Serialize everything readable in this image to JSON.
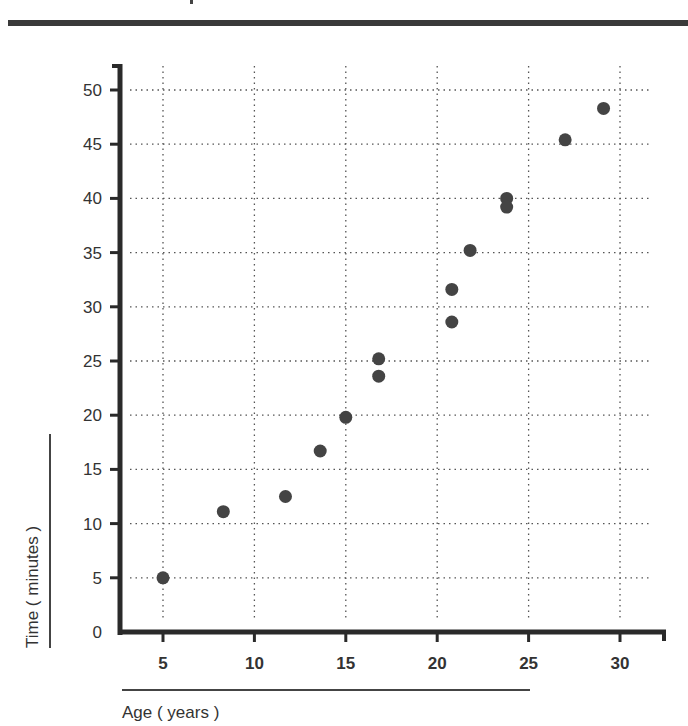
{
  "page": {
    "title_visible": false
  },
  "chart_data": {
    "type": "scatter",
    "title": "",
    "xlabel": "Age ( years )",
    "ylabel": "Time ( minutes )",
    "xlim": [
      2.5,
      32.5
    ],
    "ylim": [
      0,
      52
    ],
    "xticks": [
      5,
      10,
      15,
      20,
      25,
      30
    ],
    "yticks": [
      0,
      5,
      10,
      15,
      20,
      25,
      30,
      35,
      40,
      45,
      50
    ],
    "xtick_labels": [
      "5",
      "10",
      "15",
      "20",
      "25",
      "30"
    ],
    "ytick_labels": [
      "0",
      "5",
      "10",
      "15",
      "20",
      "25",
      "30",
      "35",
      "40",
      "45",
      "50"
    ],
    "grid": true,
    "grid_style": "dotted",
    "legend": null,
    "marker_color": "#444444",
    "series": [
      {
        "name": "Time vs Age",
        "points": [
          {
            "x": 5.0,
            "y": 5.0
          },
          {
            "x": 8.3,
            "y": 11.1
          },
          {
            "x": 11.7,
            "y": 12.5
          },
          {
            "x": 13.6,
            "y": 16.7
          },
          {
            "x": 15.0,
            "y": 19.8
          },
          {
            "x": 16.8,
            "y": 25.2
          },
          {
            "x": 16.8,
            "y": 23.6
          },
          {
            "x": 20.8,
            "y": 31.6
          },
          {
            "x": 20.8,
            "y": 28.6
          },
          {
            "x": 21.8,
            "y": 35.2
          },
          {
            "x": 23.8,
            "y": 40.0
          },
          {
            "x": 23.8,
            "y": 39.2
          },
          {
            "x": 27.0,
            "y": 45.4
          },
          {
            "x": 29.1,
            "y": 48.3
          }
        ]
      }
    ]
  }
}
